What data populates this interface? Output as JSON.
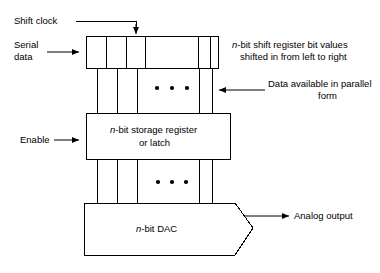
{
  "diagram": {
    "blocks": {
      "shift_register": {
        "name": "shift-register-block",
        "label": ""
      },
      "storage_register": {
        "name": "storage-register-block",
        "label_line1_italic": "n",
        "label_line1_rest": "-bit storage register",
        "label_line2": "or latch"
      },
      "dac": {
        "name": "dac-block",
        "label_italic": "n",
        "label_rest": "-bit DAC"
      }
    },
    "labels": {
      "shift_clock": "Shift clock",
      "serial_data_line1": "Serial",
      "serial_data_line2": "data",
      "enable": "Enable",
      "analog_output": "Analog output",
      "shift_note_line1_italic": "n",
      "shift_note_line1_rest": "-bit shift register bit values",
      "shift_note_line2": "shifted in from left to right",
      "parallel_note_line1": "Data available in parallel",
      "parallel_note_line2": "form"
    },
    "ellipsis": {
      "symbol": "•",
      "count": 3
    },
    "colors": {
      "line": "#000000",
      "background": "#ffffff",
      "text": "#000000"
    }
  }
}
